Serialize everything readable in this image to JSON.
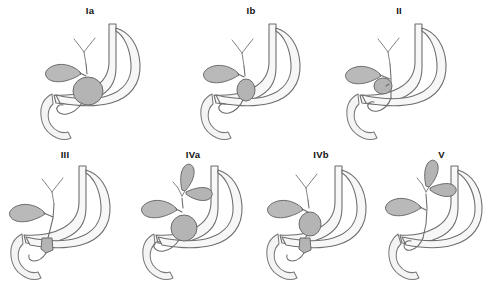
{
  "figure": {
    "background_color": "#ffffff",
    "panel_count": 7,
    "row_counts": [
      3,
      4
    ],
    "colors": {
      "cyst_fill": "#b4b4b4",
      "gallbladder_fill": "#b9b9b9",
      "organ_fill": "#f7f7f7",
      "outline_stroke": "#6b6b6b",
      "label_text": "#111111"
    }
  },
  "panels": [
    {
      "id": "panel-ia",
      "label": "Ia",
      "row": 1,
      "column": 1,
      "cyst_regions": [
        "common-bile-duct-fusiform-dilatation"
      ],
      "intrahepatic_cysts": 0,
      "has_common-duct_cyst": true,
      "anatomy": [
        "stomach",
        "duodenum",
        "gallbladder",
        "cystic-duct",
        "common-hepatic-duct",
        "intrahepatic-ducts",
        "common-bile-duct"
      ]
    },
    {
      "id": "panel-ib",
      "label": "Ib",
      "row": 1,
      "column": 2,
      "cyst_regions": [
        "common-bile-duct-segmental-dilatation"
      ],
      "intrahepatic_cysts": 0,
      "has_common-duct_cyst": true,
      "anatomy": [
        "stomach",
        "duodenum",
        "gallbladder",
        "cystic-duct",
        "common-hepatic-duct",
        "intrahepatic-ducts",
        "common-bile-duct"
      ]
    },
    {
      "id": "panel-ii",
      "label": "II",
      "row": 1,
      "column": 3,
      "cyst_regions": [
        "extrahepatic-duct-diverticulum"
      ],
      "intrahepatic_cysts": 0,
      "has_common-duct_cyst": true,
      "anatomy": [
        "stomach",
        "duodenum",
        "gallbladder",
        "cystic-duct",
        "common-hepatic-duct",
        "intrahepatic-ducts",
        "common-bile-duct"
      ]
    },
    {
      "id": "panel-iii",
      "label": "III",
      "row": 2,
      "column": 1,
      "cyst_regions": [
        "choledochocele-intraduodenal"
      ],
      "intrahepatic_cysts": 0,
      "has_common-duct_cyst": false,
      "anatomy": [
        "stomach",
        "duodenum",
        "gallbladder",
        "cystic-duct",
        "common-hepatic-duct",
        "intrahepatic-ducts",
        "common-bile-duct"
      ]
    },
    {
      "id": "panel-iva",
      "label": "IVa",
      "row": 2,
      "column": 2,
      "cyst_regions": [
        "common-bile-duct-dilatation",
        "intrahepatic-duct-cysts"
      ],
      "intrahepatic_cysts": 2,
      "has_common-duct_cyst": true,
      "anatomy": [
        "stomach",
        "duodenum",
        "gallbladder",
        "cystic-duct",
        "common-hepatic-duct",
        "intrahepatic-ducts",
        "common-bile-duct"
      ]
    },
    {
      "id": "panel-ivb",
      "label": "IVb",
      "row": 2,
      "column": 3,
      "cyst_regions": [
        "common-bile-duct-dilatation",
        "distal-duct-cyst"
      ],
      "intrahepatic_cysts": 0,
      "has_common-duct_cyst": true,
      "anatomy": [
        "stomach",
        "duodenum",
        "gallbladder",
        "cystic-duct",
        "common-hepatic-duct",
        "intrahepatic-ducts",
        "common-bile-duct"
      ]
    },
    {
      "id": "panel-v",
      "label": "V",
      "row": 2,
      "column": 4,
      "cyst_regions": [
        "intrahepatic-duct-cysts-caroli"
      ],
      "intrahepatic_cysts": 2,
      "has_common-duct_cyst": false,
      "anatomy": [
        "stomach",
        "duodenum",
        "gallbladder",
        "cystic-duct",
        "common-hepatic-duct",
        "intrahepatic-ducts",
        "common-bile-duct"
      ]
    }
  ]
}
